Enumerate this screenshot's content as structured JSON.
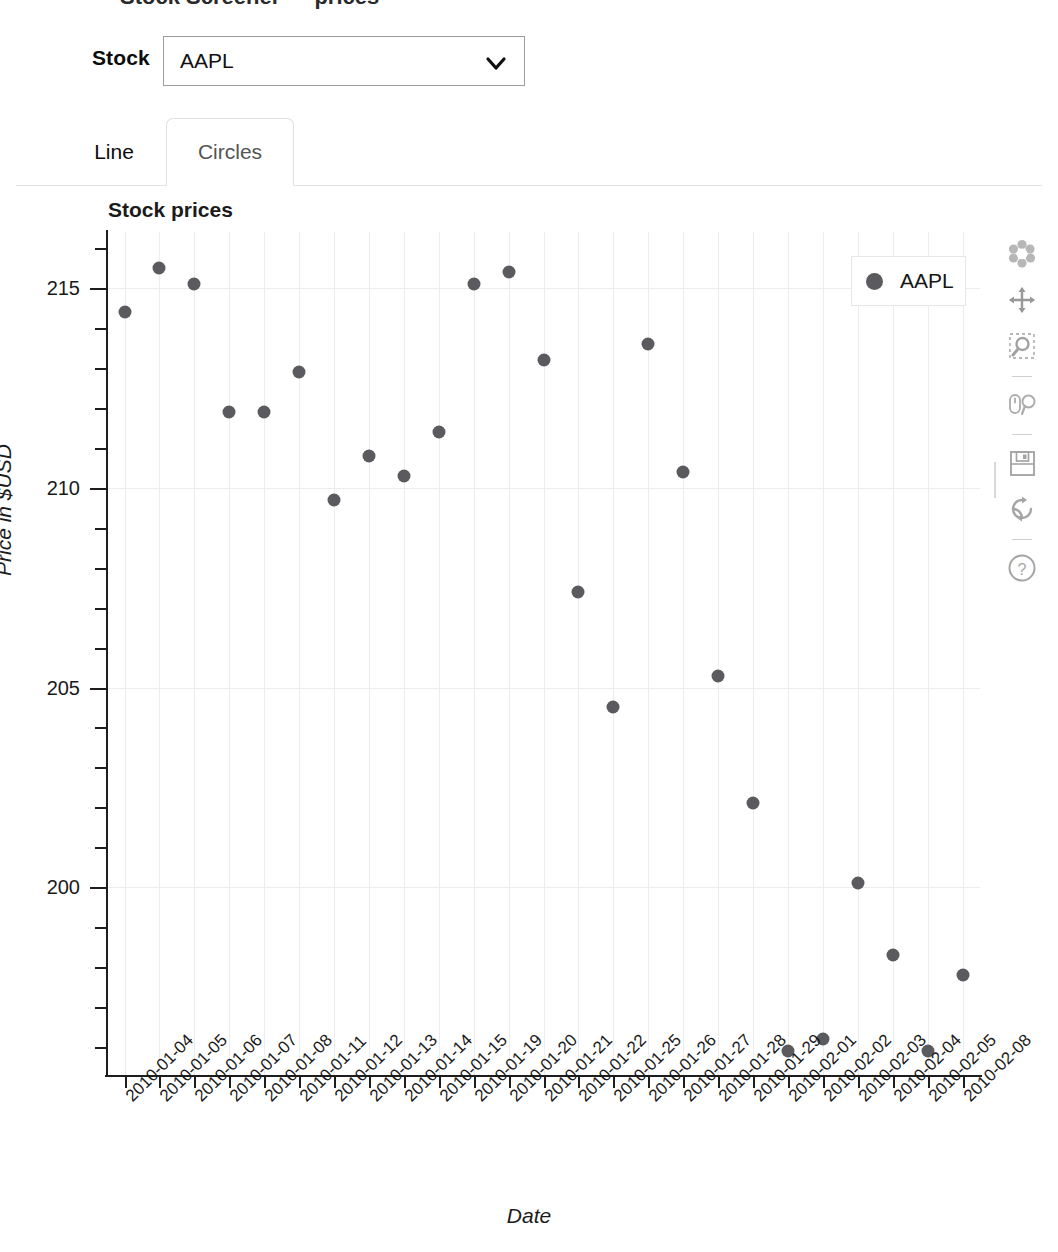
{
  "cutoff_header": "Stock Screener — prices",
  "controls": {
    "stock_label": "Stock",
    "stock_value": "AAPL",
    "chevron_icon": "chevron-down-icon"
  },
  "tabs": [
    {
      "label": "Line",
      "active": false
    },
    {
      "label": "Circles",
      "active": true
    }
  ],
  "legend": {
    "entry": "AAPL",
    "marker_color": "#5b5b5f"
  },
  "toolbar": {
    "items": [
      {
        "name": "bokeh-logo-icon",
        "title": "Bokeh"
      },
      {
        "name": "pan-tool-icon",
        "title": "Pan"
      },
      {
        "name": "box-zoom-tool-icon",
        "title": "Box Zoom"
      },
      {
        "name": "wheel-zoom-tool-icon",
        "title": "Wheel Zoom"
      },
      {
        "name": "save-tool-icon",
        "title": "Save"
      },
      {
        "name": "reset-tool-icon",
        "title": "Reset"
      },
      {
        "name": "help-tool-icon",
        "title": "Help"
      }
    ]
  },
  "chart_data": {
    "type": "scatter",
    "title": "Stock prices",
    "xlabel": "Date",
    "ylabel": "Price in $USD",
    "grid": true,
    "legend_position": "top-right",
    "marker_color": "#5b5b5f",
    "ylim": [
      195.3,
      216.4
    ],
    "yticks": [
      200,
      205,
      210,
      215
    ],
    "categories": [
      "2010-01-04",
      "2010-01-05",
      "2010-01-06",
      "2010-01-07",
      "2010-01-08",
      "2010-01-11",
      "2010-01-12",
      "2010-01-13",
      "2010-01-14",
      "2010-01-15",
      "2010-01-19",
      "2010-01-20",
      "2010-01-21",
      "2010-01-22",
      "2010-01-25",
      "2010-01-26",
      "2010-01-27",
      "2010-01-28",
      "2010-01-29",
      "2010-02-01",
      "2010-02-02",
      "2010-02-03",
      "2010-02-04",
      "2010-02-05",
      "2010-02-08"
    ],
    "series": [
      {
        "name": "AAPL",
        "values": [
          214.4,
          215.5,
          215.1,
          211.9,
          211.9,
          212.9,
          209.7,
          210.8,
          210.3,
          211.4,
          215.1,
          215.4,
          213.2,
          207.4,
          204.5,
          213.6,
          210.4,
          205.3,
          202.1,
          195.9,
          196.2,
          200.1,
          198.3,
          195.9,
          197.8
        ]
      }
    ]
  }
}
